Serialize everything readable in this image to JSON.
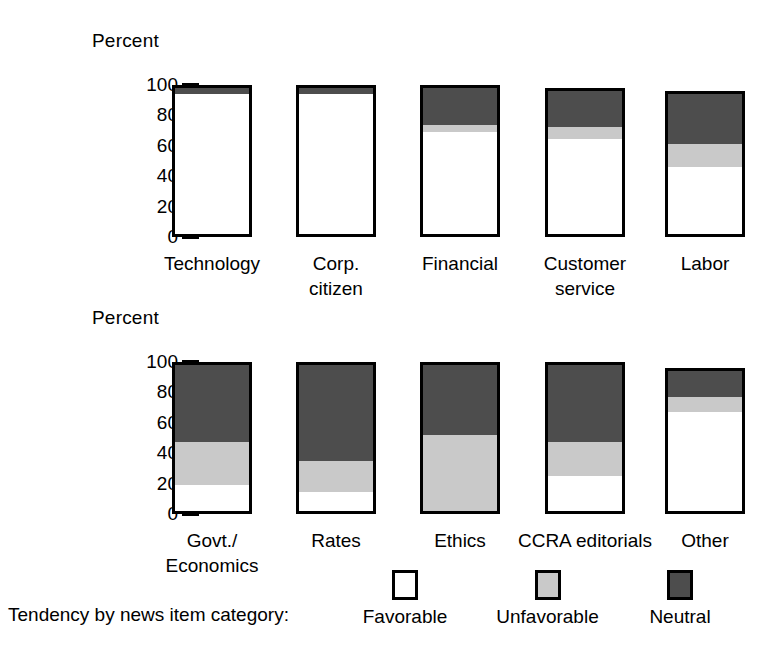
{
  "legend": {
    "caption": "Tendency by news item category:",
    "entries": [
      {
        "label": "Favorable",
        "color": "#ffffff",
        "key": "favorable"
      },
      {
        "label": "Unfavorable",
        "color": "#c9c9c9",
        "key": "unfavorable"
      },
      {
        "label": "Neutral",
        "color": "#4d4d4d",
        "key": "neutral"
      }
    ]
  },
  "chart_data": [
    {
      "type": "bar",
      "title": "",
      "subtitle": "",
      "stacked": true,
      "xlabel": "",
      "ylabel": "Percent",
      "ylim": [
        0,
        100
      ],
      "yticks": [
        0,
        20,
        40,
        60,
        80,
        100
      ],
      "grid": false,
      "legend_position": "bottom",
      "categories": [
        "Technology",
        "Corp.\ncitizen",
        "Financial",
        "Customer\nservice",
        "Labor"
      ],
      "series": [
        {
          "name": "Favorable",
          "color": "#ffffff",
          "values": [
            96,
            96,
            70,
            65,
            46
          ]
        },
        {
          "name": "Unfavorable",
          "color": "#c9c9c9",
          "values": [
            0,
            0,
            5,
            8,
            16
          ]
        },
        {
          "name": "Neutral",
          "color": "#4d4d4d",
          "values": [
            4,
            4,
            25,
            25,
            34
          ]
        }
      ]
    },
    {
      "type": "bar",
      "title": "",
      "subtitle": "",
      "stacked": true,
      "xlabel": "",
      "ylabel": "Percent",
      "ylim": [
        0,
        100
      ],
      "yticks": [
        0,
        20,
        40,
        60,
        80,
        100
      ],
      "grid": false,
      "legend_position": "bottom",
      "categories": [
        "Govt./\nEconomics",
        "Rates",
        "Ethics",
        "CCRA editorials",
        "Other"
      ],
      "series": [
        {
          "name": "Favorable",
          "color": "#ffffff",
          "values": [
            18,
            13,
            0,
            24,
            68
          ]
        },
        {
          "name": "Unfavorable",
          "color": "#c9c9c9",
          "values": [
            29,
            21,
            52,
            23,
            10
          ]
        },
        {
          "name": "Neutral",
          "color": "#4d4d4d",
          "values": [
            53,
            66,
            48,
            53,
            18
          ]
        }
      ]
    }
  ],
  "panels": [
    {
      "id": "top",
      "axis_title": "Percent",
      "yticks": [
        "100",
        "80",
        "60",
        "40",
        "20",
        "0"
      ],
      "bars": [
        {
          "label": "Technology",
          "favorable": 96,
          "unfavorable": 0,
          "neutral": 4
        },
        {
          "label": "Corp.\ncitizen",
          "favorable": 96,
          "unfavorable": 0,
          "neutral": 4
        },
        {
          "label": "Financial",
          "favorable": 70,
          "unfavorable": 5,
          "neutral": 25
        },
        {
          "label": "Customer\nservice",
          "favorable": 65,
          "unfavorable": 8,
          "neutral": 25
        },
        {
          "label": "Labor",
          "favorable": 46,
          "unfavorable": 16,
          "neutral": 34
        }
      ]
    },
    {
      "id": "bottom",
      "axis_title": "Percent",
      "yticks": [
        "100",
        "80",
        "60",
        "40",
        "20",
        "0"
      ],
      "bars": [
        {
          "label": "Govt./\nEconomics",
          "favorable": 18,
          "unfavorable": 29,
          "neutral": 53
        },
        {
          "label": "Rates",
          "favorable": 13,
          "unfavorable": 21,
          "neutral": 66
        },
        {
          "label": "Ethics",
          "favorable": 0,
          "unfavorable": 52,
          "neutral": 48
        },
        {
          "label": "CCRA editorials",
          "favorable": 24,
          "unfavorable": 23,
          "neutral": 53
        },
        {
          "label": "Other",
          "favorable": 68,
          "unfavorable": 10,
          "neutral": 18
        }
      ]
    }
  ]
}
